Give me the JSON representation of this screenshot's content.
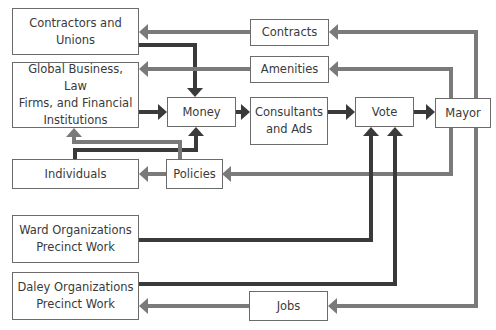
{
  "colors": {
    "dark_line": "#3a3a3a",
    "gray_line": "#7a7a7a",
    "box_border": "#6b6b6b",
    "text": "#3a3a3a"
  },
  "nodes": [
    {
      "id": "contractors",
      "label": "Contractors and\nUnions",
      "x": 12,
      "y": 8,
      "w": 127,
      "h": 47
    },
    {
      "id": "global",
      "label": "Global Business, Law\nFirms, and Financial\nInstitutions",
      "x": 12,
      "y": 62,
      "w": 127,
      "h": 66
    },
    {
      "id": "individuals",
      "label": "Individuals",
      "x": 12,
      "y": 159,
      "w": 127,
      "h": 30
    },
    {
      "id": "ward",
      "label": "Ward Organizations\nPrecinct Work",
      "x": 12,
      "y": 215,
      "w": 127,
      "h": 48
    },
    {
      "id": "daley",
      "label": "Daley Organizations\nPrecinct Work",
      "x": 12,
      "y": 272,
      "w": 127,
      "h": 48
    },
    {
      "id": "money",
      "label": "Money",
      "x": 167,
      "y": 97,
      "w": 69,
      "h": 30
    },
    {
      "id": "policies",
      "label": "Policies",
      "x": 166,
      "y": 159,
      "w": 57,
      "h": 30
    },
    {
      "id": "contracts",
      "label": "Contracts",
      "x": 250,
      "y": 19,
      "w": 79,
      "h": 27
    },
    {
      "id": "amenities",
      "label": "Amenities",
      "x": 250,
      "y": 56,
      "w": 79,
      "h": 27
    },
    {
      "id": "consultants",
      "label": "Consultants\nand Ads",
      "x": 250,
      "y": 97,
      "w": 78,
      "h": 48
    },
    {
      "id": "vote",
      "label": "Vote",
      "x": 355,
      "y": 97,
      "w": 59,
      "h": 30
    },
    {
      "id": "mayor",
      "label": "Mayor",
      "x": 435,
      "y": 98,
      "w": 56,
      "h": 30
    },
    {
      "id": "jobs",
      "label": "Jobs",
      "x": 249,
      "y": 291,
      "w": 79,
      "h": 30
    }
  ],
  "edges": [
    {
      "from": "contractors",
      "to": "money",
      "style": "dark",
      "points": "139,45 195,45 195,88",
      "arrow": "down"
    },
    {
      "from": "global",
      "to": "money",
      "style": "dark",
      "points": "139,112 158,112",
      "arrow": "right"
    },
    {
      "from": "money",
      "to": "consultants",
      "style": "dark",
      "points": "236,112 241,112",
      "arrow": "right"
    },
    {
      "from": "consultants",
      "to": "vote",
      "style": "dark",
      "points": "328,112 346,112",
      "arrow": "right"
    },
    {
      "from": "vote",
      "to": "mayor",
      "style": "dark",
      "points": "414,112 426,112",
      "arrow": "right"
    },
    {
      "from": "individuals",
      "to": "money",
      "style": "dark",
      "points": "75,159 75,150 196,150 196,136",
      "arrow": "up"
    },
    {
      "from": "policies",
      "to": "global",
      "style": "gray",
      "points": "180,159 180,142 74,142 74,137",
      "arrow": "up"
    },
    {
      "from": "mayor",
      "to": "contracts",
      "style": "gray",
      "points": "476,98 476,32 338,32",
      "arrow": "left"
    },
    {
      "from": "contracts",
      "to": "contractors",
      "style": "gray",
      "points": "250,32 148,32",
      "arrow": "left"
    },
    {
      "from": "mayor",
      "to": "amenities",
      "style": "gray",
      "points": "451,98 451,69 338,69",
      "arrow": "left"
    },
    {
      "from": "amenities",
      "to": "global",
      "style": "gray",
      "points": "250,69 148,69",
      "arrow": "left"
    },
    {
      "from": "mayor",
      "to": "policies",
      "style": "gray",
      "points": "451,128 451,174 231,174",
      "arrow": "left"
    },
    {
      "from": "policies",
      "to": "individuals",
      "style": "gray",
      "points": "166,174 148,174",
      "arrow": "left"
    },
    {
      "from": "ward",
      "to": "vote",
      "style": "dark",
      "points": "139,240 371,240 371,136",
      "arrow": "up"
    },
    {
      "from": "daley",
      "to": "vote",
      "style": "dark",
      "points": "139,284 395,284 395,136",
      "arrow": "up"
    },
    {
      "from": "mayor",
      "to": "jobs",
      "style": "gray",
      "points": "476,128 476,306 337,306",
      "arrow": "left"
    },
    {
      "from": "jobs",
      "to": "daley",
      "style": "gray",
      "points": "249,306 148,306",
      "arrow": "left"
    }
  ]
}
